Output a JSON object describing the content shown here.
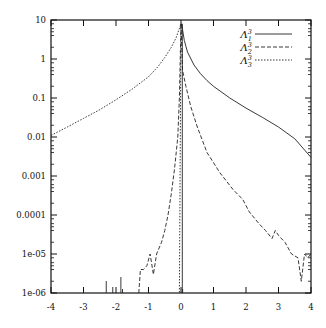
{
  "chart_data": {
    "type": "line",
    "title": "",
    "xlabel": "",
    "ylabel": "",
    "xlim": [
      -4,
      4
    ],
    "ylim": [
      1e-06,
      10
    ],
    "yscale": "log",
    "grid": false,
    "legend_position": "upper right",
    "x_ticks": [
      "-4",
      "-3",
      "-2",
      "-1",
      "0",
      "1",
      "2",
      "3",
      "4"
    ],
    "y_ticks": [
      "1e-06",
      "1e-05",
      "0.0001",
      "0.001",
      "0.01",
      "0.1",
      "1",
      "10"
    ],
    "series": [
      {
        "name": "Λ₁³",
        "label_base": "Λ",
        "label_sup": "3",
        "label_sub": "1",
        "style": "solid",
        "points": [
          [
            0.02,
            8
          ],
          [
            0.1,
            3.0
          ],
          [
            0.2,
            1.5
          ],
          [
            0.4,
            0.7
          ],
          [
            0.6,
            0.42
          ],
          [
            0.8,
            0.28
          ],
          [
            1.0,
            0.2
          ],
          [
            1.5,
            0.1
          ],
          [
            2.0,
            0.055
          ],
          [
            2.5,
            0.032
          ],
          [
            3.0,
            0.018
          ],
          [
            3.5,
            0.009
          ],
          [
            4.0,
            0.003
          ]
        ]
      },
      {
        "name": "Λ₂³",
        "label_base": "Λ",
        "label_sup": "3",
        "label_sub": "2",
        "style": "dashed",
        "points": [
          [
            -1.3,
            1e-06
          ],
          [
            -1.25,
            4e-06
          ],
          [
            -1.15,
            4e-06
          ],
          [
            -1.05,
            5e-06
          ],
          [
            -0.95,
            1e-05
          ],
          [
            -0.85,
            3e-06
          ],
          [
            -0.75,
            1e-05
          ],
          [
            -0.6,
            2e-05
          ],
          [
            -0.5,
            4e-05
          ],
          [
            -0.4,
            0.0001
          ],
          [
            -0.3,
            0.00035
          ],
          [
            -0.2,
            0.0015
          ],
          [
            -0.1,
            0.01
          ],
          [
            -0.05,
            0.1
          ],
          [
            0.0,
            8
          ],
          [
            0.05,
            0.5
          ],
          [
            0.15,
            0.2
          ],
          [
            0.3,
            0.06
          ],
          [
            0.5,
            0.018
          ],
          [
            0.8,
            0.004
          ],
          [
            1.2,
            0.0012
          ],
          [
            1.6,
            0.00045
          ],
          [
            1.9,
            0.00025
          ],
          [
            2.1,
            0.00012
          ],
          [
            2.4,
            6e-05
          ],
          [
            2.6,
            4e-05
          ],
          [
            2.8,
            2.5e-05
          ],
          [
            2.9,
            4e-05
          ],
          [
            3.0,
            3e-05
          ],
          [
            3.2,
            2e-05
          ],
          [
            3.4,
            1e-05
          ],
          [
            3.6,
            8e-06
          ],
          [
            3.7,
            2e-06
          ],
          [
            3.8,
            1e-05
          ],
          [
            3.9,
            8e-06
          ],
          [
            4.0,
            1e-05
          ]
        ]
      },
      {
        "name": "Λ₃³",
        "label_base": "Λ",
        "label_sup": "3",
        "label_sub": "3",
        "style": "dotted",
        "points": [
          [
            -4.0,
            0.011
          ],
          [
            -3.5,
            0.018
          ],
          [
            -3.0,
            0.03
          ],
          [
            -2.5,
            0.05
          ],
          [
            -2.0,
            0.09
          ],
          [
            -1.5,
            0.17
          ],
          [
            -1.0,
            0.35
          ],
          [
            -0.7,
            0.65
          ],
          [
            -0.5,
            1.1
          ],
          [
            -0.3,
            2.0
          ],
          [
            -0.15,
            3.5
          ],
          [
            0.0,
            8
          ],
          [
            -0.05,
            1e-06
          ]
        ]
      }
    ],
    "spikes": [
      -2.3,
      -2.1,
      -1.85,
      -1.8,
      0.05
    ]
  }
}
